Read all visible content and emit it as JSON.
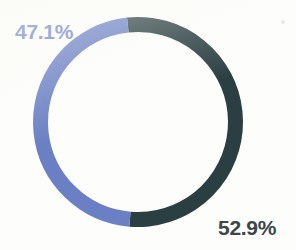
{
  "chart_data": {
    "type": "pie",
    "variant": "donut",
    "title": "",
    "subtitle": "",
    "xlabel": "",
    "ylabel": "",
    "grid": false,
    "legend": "none",
    "total": 100,
    "units": "percent",
    "categories": [
      "Segment A",
      "Segment B"
    ],
    "values": [
      52.9,
      47.1
    ],
    "labels": [
      "52.9%",
      "47.1%"
    ],
    "colors": [
      "#2b3f42",
      "#6a7fc4"
    ],
    "slices": [
      {
        "name": "Segment A",
        "label": "52.9%",
        "value": 52.9,
        "color": "#2b3f42",
        "start_angle_deg": -6,
        "end_angle_deg": 184.44,
        "label_position": "bottom-right"
      },
      {
        "name": "Segment B",
        "label": "47.1%",
        "value": 47.1,
        "color": "#6a7fc4",
        "start_angle_deg": 184.44,
        "end_angle_deg": 354,
        "label_position": "top-left"
      }
    ],
    "geometry": {
      "center_x": 138,
      "center_y": 122,
      "outer_radius": 105,
      "inner_radius": 90,
      "stroke_width": 15,
      "rotation_deg": -6
    }
  },
  "labels": {
    "blue_slice": "47.1%",
    "dark_slice": "52.9%"
  },
  "theme": {
    "background": "#fdfdfb",
    "accent_blue": "#6a7fc4",
    "accent_dark": "#2b3f42",
    "dark_text": "#3c4547"
  }
}
